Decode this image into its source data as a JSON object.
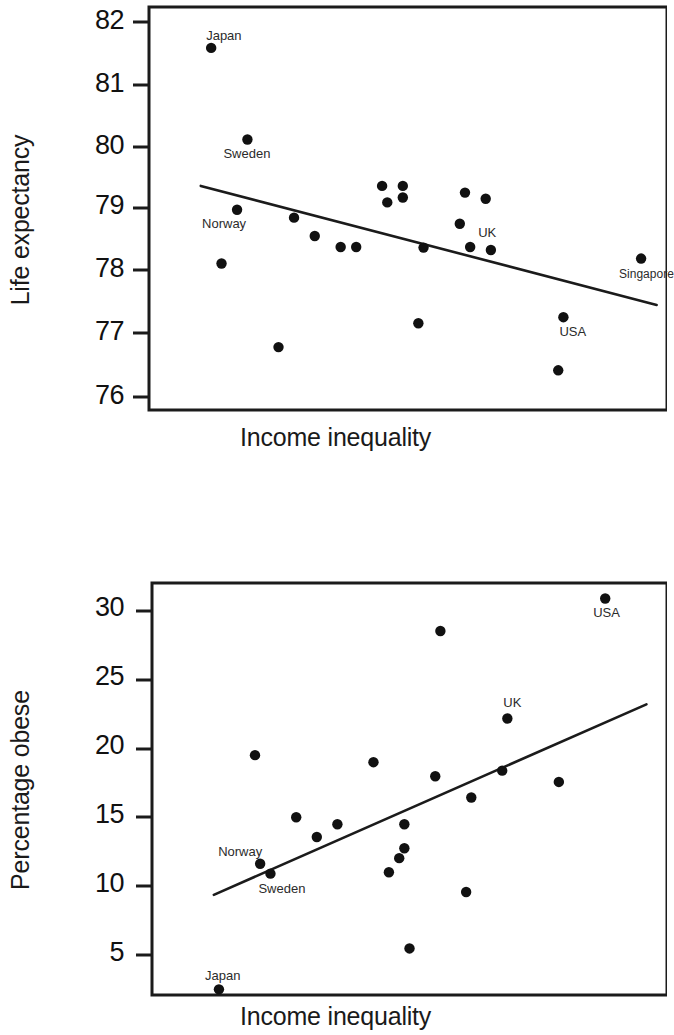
{
  "figures": [
    {
      "id": "life-expectancy",
      "y_axis_title": "Life expectancy",
      "x_axis_title": "Income inequality",
      "tick_labels": [
        "82",
        "81",
        "80",
        "79",
        "78",
        "77",
        "76"
      ]
    },
    {
      "id": "percentage-obese",
      "y_axis_title": "Percentage obese",
      "x_axis_title": "Income inequality",
      "tick_labels": [
        "30",
        "25",
        "20",
        "15",
        "10",
        "5"
      ]
    }
  ],
  "chart_data": [
    {
      "type": "scatter",
      "title": "",
      "xlabel": "Income inequality",
      "ylabel": "Life expectancy",
      "ylim": [
        75.7,
        82.3
      ],
      "yticks": [
        82,
        81,
        80,
        79,
        78,
        77,
        76
      ],
      "grid": false,
      "legend": "none",
      "annotations": [
        "Japan",
        "Sweden",
        "Norway",
        "UK",
        "Singapore",
        "USA"
      ],
      "trendline": {
        "visible": true,
        "direction": "negative",
        "x": [
          0.1,
          0.98
        ],
        "y": [
          79.37,
          77.42
        ]
      },
      "points": [
        {
          "label": "Japan",
          "x": 0.12,
          "y": 81.63
        },
        {
          "label": "Sweden",
          "x": 0.19,
          "y": 80.13
        },
        {
          "label": "Norway",
          "x": 0.17,
          "y": 78.98
        },
        {
          "label": "",
          "x": 0.14,
          "y": 78.1
        },
        {
          "label": "",
          "x": 0.25,
          "y": 76.73
        },
        {
          "label": "",
          "x": 0.28,
          "y": 78.85
        },
        {
          "label": "",
          "x": 0.32,
          "y": 78.55
        },
        {
          "label": "",
          "x": 0.37,
          "y": 78.37
        },
        {
          "label": "",
          "x": 0.4,
          "y": 78.37
        },
        {
          "label": "",
          "x": 0.45,
          "y": 79.37
        },
        {
          "label": "",
          "x": 0.46,
          "y": 79.1
        },
        {
          "label": "",
          "x": 0.49,
          "y": 79.37
        },
        {
          "label": "",
          "x": 0.49,
          "y": 79.18
        },
        {
          "label": "",
          "x": 0.53,
          "y": 78.36
        },
        {
          "label": "",
          "x": 0.52,
          "y": 77.12
        },
        {
          "label": "",
          "x": 0.61,
          "y": 79.26
        },
        {
          "label": "",
          "x": 0.6,
          "y": 78.75
        },
        {
          "label": "",
          "x": 0.65,
          "y": 79.16
        },
        {
          "label": "UK",
          "x": 0.62,
          "y": 78.37
        },
        {
          "label": "",
          "x": 0.66,
          "y": 78.32
        },
        {
          "label": "USA",
          "x": 0.8,
          "y": 77.22
        },
        {
          "label": "",
          "x": 0.79,
          "y": 76.35
        },
        {
          "label": "Singapore",
          "x": 0.95,
          "y": 78.18
        }
      ]
    },
    {
      "type": "scatter",
      "title": "",
      "xlabel": "Income inequality",
      "ylabel": "Percentage obese",
      "ylim": [
        2.8,
        32.0
      ],
      "yticks": [
        30,
        25,
        20,
        15,
        10,
        5
      ],
      "grid": false,
      "legend": "none",
      "annotations": [
        "Japan",
        "Sweden",
        "Norway",
        "UK",
        "USA"
      ],
      "trendline": {
        "visible": true,
        "direction": "positive",
        "x": [
          0.12,
          0.96
        ],
        "y": [
          9.9,
          23.4
        ]
      },
      "points": [
        {
          "label": "Japan",
          "x": 0.13,
          "y": 3.2
        },
        {
          "label": "Norway",
          "x": 0.21,
          "y": 12.1
        },
        {
          "label": "Sweden",
          "x": 0.23,
          "y": 11.4
        },
        {
          "label": "",
          "x": 0.2,
          "y": 19.8
        },
        {
          "label": "",
          "x": 0.28,
          "y": 15.4
        },
        {
          "label": "",
          "x": 0.32,
          "y": 14.0
        },
        {
          "label": "",
          "x": 0.36,
          "y": 14.9
        },
        {
          "label": "",
          "x": 0.43,
          "y": 19.3
        },
        {
          "label": "",
          "x": 0.46,
          "y": 11.5
        },
        {
          "label": "",
          "x": 0.49,
          "y": 14.9
        },
        {
          "label": "",
          "x": 0.49,
          "y": 13.2
        },
        {
          "label": "",
          "x": 0.48,
          "y": 12.5
        },
        {
          "label": "",
          "x": 0.5,
          "y": 6.1
        },
        {
          "label": "",
          "x": 0.56,
          "y": 28.6
        },
        {
          "label": "",
          "x": 0.55,
          "y": 18.3
        },
        {
          "label": "",
          "x": 0.62,
          "y": 16.8
        },
        {
          "label": "",
          "x": 0.61,
          "y": 10.1
        },
        {
          "label": "UK",
          "x": 0.69,
          "y": 22.4
        },
        {
          "label": "",
          "x": 0.68,
          "y": 18.7
        },
        {
          "label": "",
          "x": 0.79,
          "y": 17.9
        },
        {
          "label": "USA",
          "x": 0.88,
          "y": 30.9
        }
      ]
    }
  ]
}
